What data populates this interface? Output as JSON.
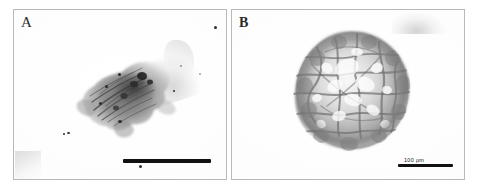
{
  "figure": {
    "type": "micrograph-figure",
    "panel_count": 2,
    "background_color": "#ffffff",
    "border_color": "#b9b9b9"
  },
  "panels": [
    {
      "id": "A",
      "label": "A",
      "subject": "irregular dark-stained cell aggregate",
      "scalebar": {
        "present": true,
        "label": "",
        "position": "bottom-right"
      },
      "specks": [
        {
          "x": 200,
          "y": 16,
          "r": 1.6
        },
        {
          "x": 49,
          "y": 123,
          "r": 1.1
        },
        {
          "x": 53,
          "y": 122,
          "r": 1.3
        },
        {
          "x": 104,
          "y": 63,
          "r": 1.6
        },
        {
          "x": 91,
          "y": 75,
          "r": 1.4
        },
        {
          "x": 85,
          "y": 92,
          "r": 1.5
        },
        {
          "x": 104,
          "y": 110,
          "r": 1.7
        },
        {
          "x": 159,
          "y": 80,
          "r": 1.2
        },
        {
          "x": 125,
          "y": 155,
          "r": 1.5
        },
        {
          "x": 166,
          "y": 55,
          "r": 0.9
        },
        {
          "x": 185,
          "y": 63,
          "r": 0.8
        }
      ]
    },
    {
      "id": "B",
      "label": "B",
      "subject": "spherical multicellular spheroid with reticular cell borders",
      "scalebar": {
        "present": true,
        "label": "100 μm",
        "value": 100,
        "unit": "μm",
        "position": "bottom-right"
      },
      "specks": []
    }
  ],
  "scalebar_color": "#111111",
  "label_color": "#2b2b2b"
}
